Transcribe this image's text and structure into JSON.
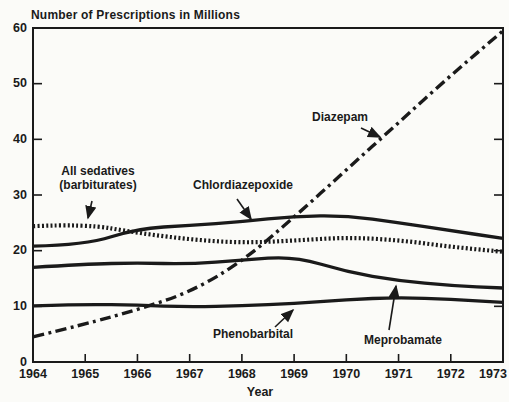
{
  "chart_data": {
    "type": "line",
    "title": "Number of Prescriptions in Millions",
    "xlabel": "Year",
    "ylabel": "",
    "x": [
      1964,
      1965,
      1966,
      1967,
      1968,
      1969,
      1970,
      1971,
      1972,
      1973
    ],
    "xlim": [
      1964,
      1973
    ],
    "ylim": [
      0,
      60
    ],
    "yticks": [
      0,
      10,
      20,
      30,
      40,
      50,
      60
    ],
    "inner_yticks": [
      10,
      20,
      30,
      40,
      50
    ],
    "inner_xticks": [
      1965,
      1966,
      1967,
      1968,
      1969,
      1970,
      1971,
      1972
    ],
    "grid": false,
    "frame": "full-box",
    "legend_position": "inline-annotations",
    "ink_color": "#1a1a1a",
    "paper_color": "#fbfbf8",
    "series": [
      {
        "name": "Meprobamate",
        "line_style": "solid",
        "values": [
          17.0,
          17.6,
          17.8,
          17.6,
          18.3,
          19.0,
          16.2,
          14.6,
          13.7,
          13.3
        ]
      },
      {
        "name": "Phenobarbital",
        "line_style": "solid",
        "values": [
          10.1,
          10.4,
          10.2,
          9.9,
          10.1,
          10.5,
          11.2,
          11.6,
          11.3,
          10.7
        ]
      },
      {
        "name": "Chlordiazepoxide",
        "line_style": "solid",
        "values": [
          20.8,
          21.0,
          24.0,
          24.5,
          25.2,
          26.2,
          26.3,
          25.0,
          23.6,
          22.2
        ]
      },
      {
        "name": "All sedatives (barbiturates)",
        "line_style": "dotted",
        "values": [
          24.4,
          24.8,
          23.2,
          22.0,
          21.4,
          21.8,
          22.4,
          21.9,
          20.7,
          19.8
        ]
      },
      {
        "name": "Diazepam",
        "line_style": "dash-dot",
        "values": [
          4.5,
          6.8,
          9.4,
          12.5,
          18.0,
          26.0,
          34.5,
          43.0,
          51.5,
          59.5
        ]
      }
    ],
    "annotations": [
      {
        "text": "All sedatives\n(barbiturates)",
        "target_series": "All sedatives (barbiturates)",
        "label_cx": 98,
        "label_top": 165,
        "arrow": {
          "x1": 92,
          "y1": 201,
          "x2": 88,
          "y2": 218
        }
      },
      {
        "text": "Chlordiazepoxide",
        "target_series": "Chlordiazepoxide",
        "label_cx": 243,
        "label_top": 179,
        "arrow": {
          "x1": 237,
          "y1": 199,
          "x2": 251,
          "y2": 219
        }
      },
      {
        "text": "Diazepam",
        "target_series": "Diazepam",
        "label_cx": 340,
        "label_top": 111,
        "arrow": {
          "x1": 361,
          "y1": 128,
          "x2": 380,
          "y2": 137
        }
      },
      {
        "text": "Phenobarbital",
        "target_series": "Phenobarbital",
        "label_cx": 253,
        "label_top": 328,
        "arrow": {
          "x1": 275,
          "y1": 327,
          "x2": 293,
          "y2": 310
        }
      },
      {
        "text": "Meprobamate",
        "target_series": "Meprobamate",
        "label_cx": 403,
        "label_top": 334,
        "arrow": {
          "x1": 389,
          "y1": 330,
          "x2": 396,
          "y2": 286
        }
      }
    ]
  }
}
